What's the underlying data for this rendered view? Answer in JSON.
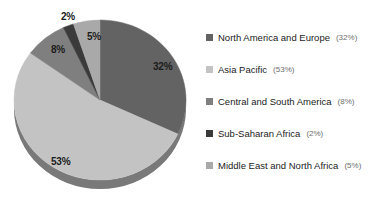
{
  "chart_data": {
    "type": "pie",
    "title": "",
    "categories": [
      "North America and Europe",
      "Asia Pacific",
      "Central and South America",
      "Sub-Saharan Africa",
      "Middle East and North Africa"
    ],
    "values": [
      32,
      53,
      8,
      2,
      5
    ],
    "value_labels": [
      "32%",
      "53%",
      "8%",
      "2%",
      "5%"
    ],
    "unit": "%",
    "colors": [
      "#636363",
      "#c3c3c3",
      "#7f7f7f",
      "#3a3a3a",
      "#a9a9a9"
    ],
    "legend_position": "right",
    "grid": false,
    "style": "3d-pie",
    "start_angle_deg": 0,
    "direction": "clockwise",
    "slice_order_clockwise_from_top": [
      "North America and Europe",
      "Asia Pacific",
      "Central and South America",
      "Sub-Saharan Africa",
      "Middle East and North Africa"
    ]
  },
  "pie": {
    "labels": [
      {
        "text": "32%",
        "x": 153,
        "y": 61,
        "placement": "inside"
      },
      {
        "text": "53%",
        "x": 51,
        "y": 156,
        "placement": "inside"
      },
      {
        "text": "8%",
        "x": 51,
        "y": 44,
        "placement": "inside"
      },
      {
        "text": "2%",
        "x": 61,
        "y": 11,
        "placement": "outside"
      },
      {
        "text": "5%",
        "x": 87,
        "y": 31,
        "placement": "inside"
      }
    ]
  },
  "legend": {
    "items": [
      {
        "label": "North America and Europe",
        "value": "(32%)",
        "color": "#636363"
      },
      {
        "label": "Asia Pacific",
        "value": "(53%)",
        "color": "#c3c3c3"
      },
      {
        "label": "Central and South America",
        "value": "(8%)",
        "color": "#7f7f7f"
      },
      {
        "label": "Sub-Saharan Africa",
        "value": "(2%)",
        "color": "#3a3a3a"
      },
      {
        "label": "Middle East and North Africa",
        "value": "(5%)",
        "color": "#a9a9a9"
      }
    ]
  }
}
